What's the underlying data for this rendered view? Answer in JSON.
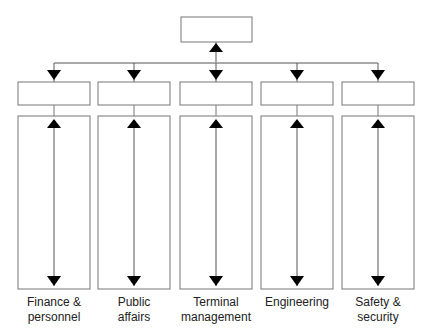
{
  "diagram": {
    "type": "org-chart",
    "top_box": {
      "label": ""
    },
    "departments": [
      {
        "label": "Finance &\npersonnel",
        "line1": "Finance &",
        "line2": "personnel",
        "cx": 54
      },
      {
        "label": "Public\naffairs",
        "line1": "Public",
        "line2": "affairs",
        "cx": 134
      },
      {
        "label": "Terminal\nmanagement",
        "line1": "Terminal",
        "line2": "management",
        "cx": 216
      },
      {
        "label": "Engineering",
        "line1": "Engineering",
        "line2": "",
        "cx": 297
      },
      {
        "label": "Safety &\nsecurity",
        "line1": "Safety &",
        "line2": "security",
        "cx": 378
      }
    ],
    "colors": {
      "line": "#666666",
      "arrow": "#000000",
      "box_border": "#777777"
    }
  }
}
